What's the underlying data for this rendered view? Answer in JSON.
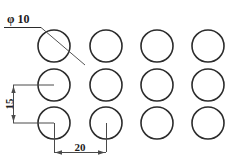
{
  "drawing": {
    "title": "Hole Pattern Detail",
    "background_color": "#ffffff",
    "line_color": "#2b2b2b",
    "dimension_color": "#4a4a4a",
    "units_note": "",
    "annotations": {
      "diameter_label": "φ 10",
      "vertical_pitch_label": "15",
      "horizontal_pitch_label": "20"
    },
    "holes": {
      "rows": 3,
      "columns": 4,
      "diameter_value": 10,
      "row_pitch_value": 15,
      "column_pitch_value": 20,
      "radius_px": 16,
      "column_centers_px": [
        54,
        106,
        157,
        208
      ],
      "row_centers_px": [
        46,
        85,
        123
      ]
    },
    "dimensions": [
      {
        "name": "diameter",
        "label": "φ 10",
        "kind": "leader",
        "text_x": 7,
        "text_y": 20,
        "shelf_x1": 4,
        "shelf_x2": 41,
        "shelf_y": 27,
        "leader_x1": 41,
        "leader_y1": 27,
        "leader_x2": 85,
        "leader_y2": 65
      },
      {
        "name": "vertical-pitch",
        "label": "15",
        "kind": "linear-vertical",
        "line_x": 13,
        "line_y1": 85,
        "line_y2": 123,
        "ext_y1": 85,
        "ext_y2": 123,
        "ext_x1": 13,
        "ext_x2": 54,
        "text_x": 10,
        "text_y": 104
      },
      {
        "name": "horizontal-pitch",
        "label": "20",
        "kind": "linear-horizontal",
        "line_y": 152,
        "line_x1": 54,
        "line_x2": 106,
        "ext_x1": 54,
        "ext_x2": 106,
        "ext_y1": 123,
        "ext_y2": 152,
        "text_x": 80,
        "text_y": 148
      }
    ]
  }
}
